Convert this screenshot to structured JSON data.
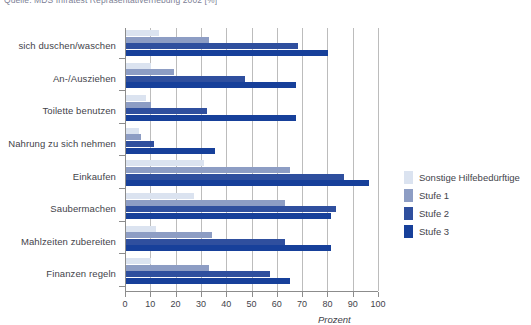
{
  "source_caption": "Quelle: MDS Infratest Repräsentativerhebung 2002 [%]",
  "axis": {
    "x_title": "Prozent",
    "ticks": [
      "0",
      "10",
      "20",
      "30",
      "40",
      "50",
      "60",
      "70",
      "80",
      "90",
      "100"
    ]
  },
  "legend": {
    "items": [
      {
        "label": "Sonstige Hilfebedürftige",
        "color": "#dbe3f0"
      },
      {
        "label": "Stufe 1",
        "color": "#8d9dc4"
      },
      {
        "label": "Stufe 2",
        "color": "#2f4f9e"
      },
      {
        "label": "Stufe 3",
        "color": "#17409a"
      }
    ]
  },
  "chart_data": {
    "type": "bar",
    "orientation": "horizontal",
    "title": "",
    "xlabel": "Prozent",
    "ylabel": "",
    "xlim": [
      0,
      100
    ],
    "grid": true,
    "legend_position": "right",
    "categories": [
      "sich duschen/waschen",
      "An-/Ausziehen",
      "Toilette benutzen",
      "Nahrung zu sich nehmen",
      "Einkaufen",
      "Saubermachen",
      "Mahlzeiten zubereiten",
      "Finanzen regeln"
    ],
    "series": [
      {
        "name": "Sonstige Hilfebedürftige",
        "color": "#dbe3f0",
        "values": [
          13,
          10,
          8,
          5,
          31,
          27,
          12,
          10
        ]
      },
      {
        "name": "Stufe 1",
        "color": "#8d9dc4",
        "values": [
          33,
          19,
          10,
          6,
          65,
          63,
          34,
          33
        ]
      },
      {
        "name": "Stufe 2",
        "color": "#2f4f9e",
        "values": [
          68,
          47,
          32,
          11,
          86,
          83,
          63,
          57
        ]
      },
      {
        "name": "Stufe 3",
        "color": "#17409a",
        "values": [
          80,
          67,
          67,
          35,
          96,
          81,
          81,
          65
        ]
      }
    ]
  }
}
